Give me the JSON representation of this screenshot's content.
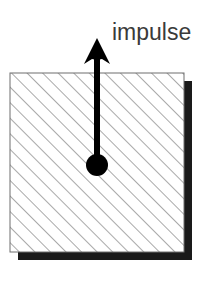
{
  "figure": {
    "background_color": "#ffffff",
    "annotations": {
      "impulse_label": "impulse"
    },
    "block": {
      "name": "hatched-square",
      "x": 10,
      "y": 73,
      "width": 174,
      "height": 179,
      "fill_pattern": "diagonal-hatch-45-up-right",
      "hatch_color": "#9a9a9a",
      "hatch_spacing_px": 11,
      "border_color": "#6e6e6e",
      "border_width_px": 1
    },
    "shadow": {
      "name": "drop-shadow",
      "color": "#1a1a1a",
      "offset_x": 8,
      "offset_y": 8,
      "thickness_px": 8
    },
    "arrow": {
      "name": "impulse-arrow",
      "color": "#000000",
      "direction": "up",
      "tail_x": 97,
      "tail_y": 165,
      "tip_x": 97,
      "tip_y": 38,
      "shaft_width_px": 6,
      "head_width_px": 26,
      "head_length_px": 24
    },
    "application_point": {
      "name": "center-of-mass-dot",
      "color": "#000000",
      "cx": 97,
      "cy": 165,
      "r": 11
    },
    "label_position": {
      "x": 112,
      "y": 40
    }
  }
}
